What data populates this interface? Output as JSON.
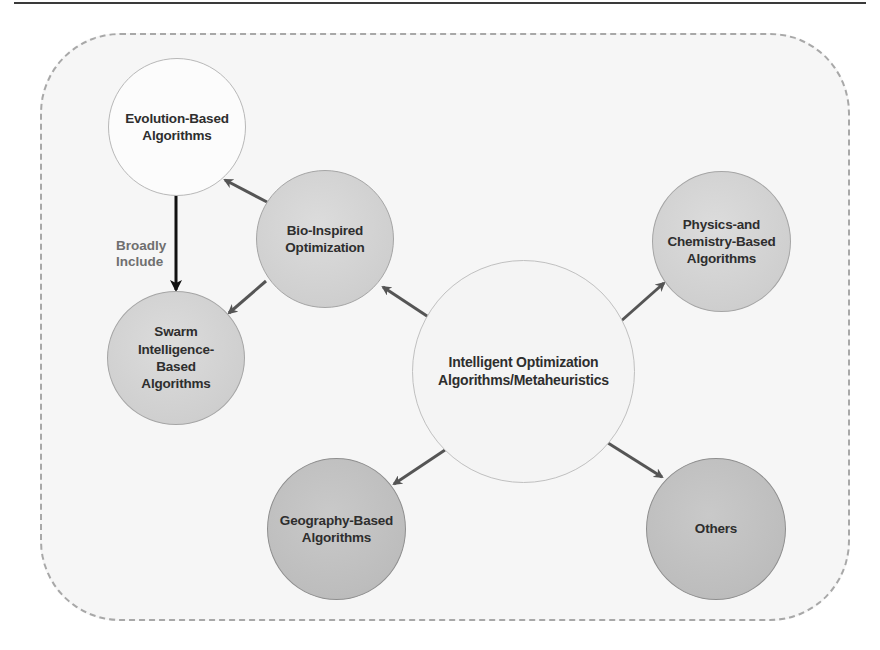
{
  "diagram": {
    "nodes": {
      "center": {
        "label": "Intelligent Optimization\nAlgorithms/Metaheuristics"
      },
      "bio": {
        "label": "Bio-Inspired\nOptimization"
      },
      "evolution": {
        "label": "Evolution-Based\nAlgorithms"
      },
      "swarm": {
        "label": "Swarm\nIntelligence-\nBased\nAlgorithms"
      },
      "physics": {
        "label": "Physics-and\nChemistry-Based\nAlgorithms"
      },
      "geography": {
        "label": "Geography-Based\nAlgorithms"
      },
      "others": {
        "label": "Others"
      }
    },
    "edges": [
      {
        "from": "center",
        "to": "bio"
      },
      {
        "from": "center",
        "to": "physics"
      },
      {
        "from": "center",
        "to": "geography"
      },
      {
        "from": "center",
        "to": "others"
      },
      {
        "from": "bio",
        "to": "evolution"
      },
      {
        "from": "bio",
        "to": "swarm"
      },
      {
        "from": "evolution",
        "to": "swarm",
        "label": "Broadly\nInclude"
      }
    ],
    "edge_label_evolution_swarm": "Broadly\nInclude"
  }
}
